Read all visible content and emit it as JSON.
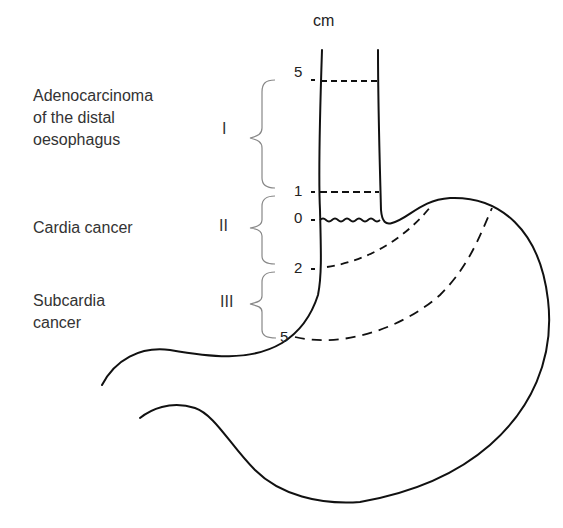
{
  "diagram": {
    "unit_label": "cm",
    "categories": [
      {
        "roman": "I",
        "label": "Adenocarcinoma\nof the distal\noesophagus"
      },
      {
        "roman": "II",
        "label": "Cardia cancer"
      },
      {
        "roman": "III",
        "label": "Subcardia\ncancer"
      }
    ],
    "scale_ticks": [
      "5",
      "1",
      "0",
      "2",
      "5"
    ],
    "colors": {
      "line": "#111111",
      "brace": "#888888",
      "text": "#333333"
    }
  }
}
